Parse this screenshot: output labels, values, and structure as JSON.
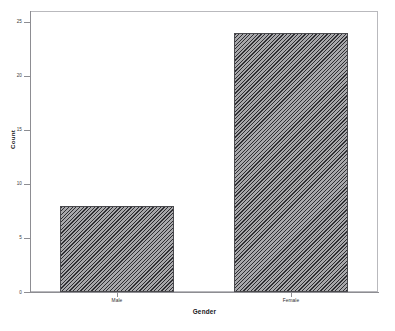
{
  "chart_data": {
    "type": "bar",
    "title": "",
    "subtitle": "",
    "xlabel": "Gender",
    "ylabel": "Count",
    "categories": [
      "Male",
      "Female"
    ],
    "values": [
      8,
      24
    ],
    "ylim": [
      0,
      26
    ],
    "yticks": [
      0,
      5,
      10,
      15,
      20,
      25
    ],
    "ytick_labels": [
      "0",
      "5",
      "10",
      "15",
      "20",
      "25"
    ],
    "grid": false,
    "legend": false,
    "legend_position": "none",
    "bar_fill": "#a8a8ab",
    "bar_pattern": "diagonal-hatch",
    "bar_edge_color": "#4a4a4e",
    "frame_color": "#b9b9bd",
    "background": "#ffffff"
  },
  "caption": {
    "text": ""
  }
}
